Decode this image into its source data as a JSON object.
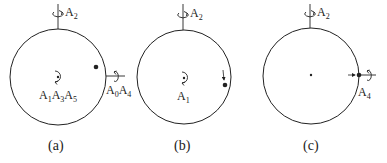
{
  "panels": [
    {
      "caption": "(a)",
      "top_label": {
        "base": "A",
        "sub": "2"
      },
      "center_label": [
        {
          "base": "A",
          "sub": "1"
        },
        {
          "base": "A",
          "sub": "3"
        },
        {
          "base": "A",
          "sub": "5"
        }
      ],
      "side_label": [
        {
          "base": "A",
          "sub": "0"
        },
        {
          "base": "A",
          "sub": "4"
        }
      ]
    },
    {
      "caption": "(b)",
      "top_label": {
        "base": "A",
        "sub": "2"
      },
      "center_label": [
        {
          "base": "A",
          "sub": "1"
        }
      ]
    },
    {
      "caption": "(c)",
      "top_label": {
        "base": "A",
        "sub": "2"
      },
      "side_label": [
        {
          "base": "A",
          "sub": "4"
        }
      ]
    }
  ],
  "colors": {
    "stroke": "#222222",
    "background": "#ffffff"
  }
}
